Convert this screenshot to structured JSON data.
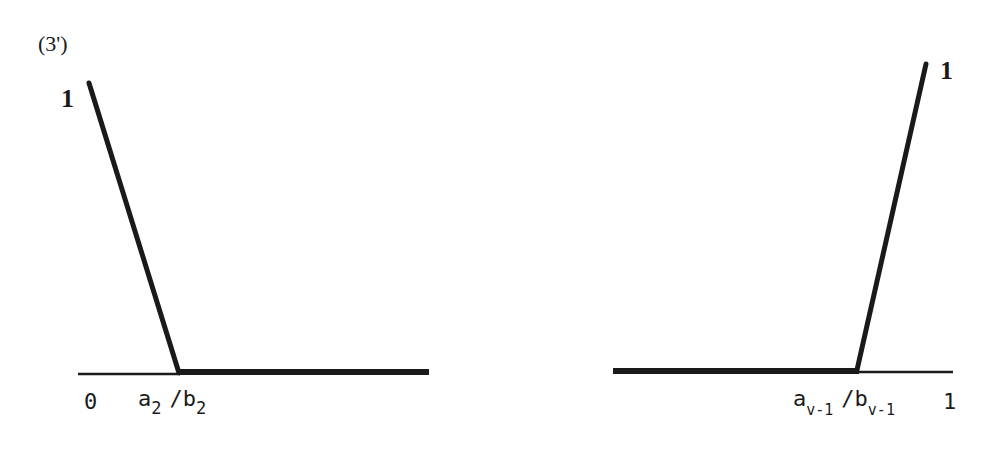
{
  "figure": {
    "label": "(3')",
    "left_panel": {
      "y_top_label": "1",
      "x_origin_label": "0",
      "x_break_label": {
        "numerator_symbol": "a",
        "numerator_subscript": "2",
        "separator": "/",
        "denominator_symbol": "b",
        "denominator_subscript": "2"
      },
      "description": "Line descending from (0,1) to (a2/b2, 0), then flat at 0 to the right"
    },
    "right_panel": {
      "y_top_label": "1",
      "x_end_label": "1",
      "x_break_label": {
        "numerator_symbol": "a",
        "numerator_subscript": "v-1",
        "separator": "/",
        "denominator_symbol": "b",
        "denominator_subscript": "v-1"
      },
      "description": "Flat at 0 up to a_{v-1}/b_{v-1}, then rising line to (1,1)"
    },
    "colors": {
      "ink": "#1a1a1a",
      "background": "#ffffff"
    }
  }
}
